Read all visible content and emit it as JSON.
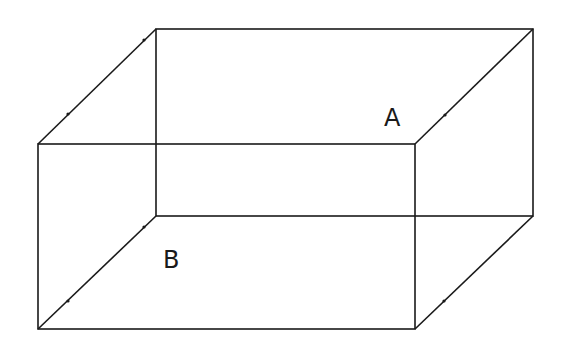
{
  "diagram": {
    "type": "wireframe-cuboid",
    "labels": {
      "a": "A",
      "b": "B"
    },
    "front_face": {
      "x1": 38,
      "y1": 144,
      "x2": 415,
      "y2": 329
    },
    "back_face": {
      "x1": 156,
      "y1": 29,
      "x2": 533,
      "y2": 216
    },
    "line_color": "#1a1a1a",
    "background": "#ffffff"
  }
}
